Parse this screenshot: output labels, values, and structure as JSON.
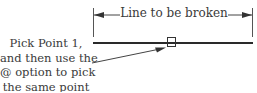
{
  "diagram": {
    "dimension_label": "Line to be broken",
    "callout_lines": [
      "Pick Point 1,",
      "and then use the",
      "@ option to pick",
      "the same point"
    ],
    "colors": {
      "line": "#2a2a2a",
      "text": "#3a3a3a",
      "background": "#ffffff"
    }
  }
}
